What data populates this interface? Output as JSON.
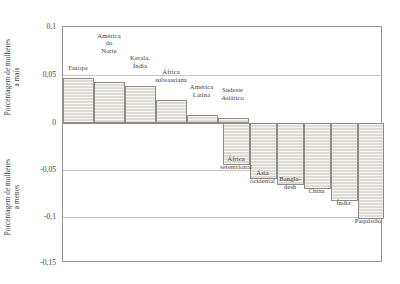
{
  "axis_titles": {
    "top": {
      "line1": "Porcentagem de mulheres",
      "line2": "a mais"
    },
    "bottom": {
      "line1": "Porcentagem de mulheres",
      "line2": "a menos"
    }
  },
  "yticks": [
    "0,1",
    "0,05",
    "0",
    "-0,05",
    "-0,1",
    "-0,15"
  ],
  "chart_data": {
    "type": "bar",
    "title": "",
    "xlabel": "",
    "ylabel": "Porcentagem de mulheres a mais / a menos",
    "ylim": [
      -0.15,
      0.1
    ],
    "yticks": [
      0.1,
      0.05,
      0,
      -0.05,
      -0.1,
      -0.15
    ],
    "ytick_labels": [
      "0,1",
      "0,05",
      "0",
      "-0,05",
      "-0,1",
      "-0,15"
    ],
    "grid": true,
    "legend": "none",
    "orientation": "vertical",
    "categories": [
      "Europa",
      "América do Norte",
      "Kerala, Índia",
      "África subsaariana",
      "América Latina",
      "Sudeste Asiático",
      "África setentrional",
      "Ásia ocidental",
      "Bangladesh",
      "China",
      "Índia",
      "Paquistão"
    ],
    "values": [
      0.048,
      0.043,
      0.039,
      0.024,
      0.008,
      0.005,
      -0.045,
      -0.06,
      -0.066,
      -0.071,
      -0.084,
      -0.103
    ]
  },
  "bars": [
    {
      "name": "Europa",
      "label_lines": [
        "Europa"
      ],
      "value": 0.048,
      "x": 62,
      "w": 31,
      "top": 77,
      "bottom": 122,
      "label_x": 58,
      "label_y": 64,
      "label_w": 40
    },
    {
      "name": "América do Norte",
      "label_lines": [
        "América",
        "do",
        "Norte"
      ],
      "value": 0.043,
      "x": 93,
      "w": 31,
      "top": 81,
      "bottom": 122,
      "label_x": 88,
      "label_y": 47,
      "label_w": 42
    },
    {
      "name": "Kerala, Índia",
      "label_lines": [
        "Kerala,",
        "Índia"
      ],
      "value": 0.039,
      "x": 124,
      "w": 31,
      "top": 85,
      "bottom": 122,
      "label_x": 119,
      "label_y": 62,
      "label_w": 42
    },
    {
      "name": "África subsaariana",
      "label_lines": [
        "África",
        "subsaariana"
      ],
      "value": 0.024,
      "x": 155,
      "w": 31,
      "top": 99,
      "bottom": 122,
      "label_x": 142,
      "label_y": 76,
      "label_w": 58
    },
    {
      "name": "América Latina",
      "label_lines": [
        "América",
        "Latina"
      ],
      "value": 0.008,
      "x": 186,
      "w": 31,
      "top": 114,
      "bottom": 122,
      "label_x": 176,
      "label_y": 91,
      "label_w": 51
    },
    {
      "name": "Sudeste Asiático",
      "label_lines": [
        "Sudeste",
        "Asiático"
      ],
      "value": 0.005,
      "x": 217,
      "w": 31,
      "top": 117,
      "bottom": 122,
      "label_x": 207,
      "label_y": 94,
      "label_w": 51
    },
    {
      "name": "África setentrional",
      "label_lines": [
        "África",
        "setentrional"
      ],
      "value": -0.045,
      "x": 222,
      "w": 27,
      "top": 122,
      "bottom": 164,
      "label_x": 208,
      "label_y": 163,
      "label_w": 56
    },
    {
      "name": "Ásia ocidental",
      "label_lines": [
        "Ásia",
        "ocidental"
      ],
      "value": -0.06,
      "x": 249,
      "w": 27,
      "top": 122,
      "bottom": 178,
      "label_x": 238,
      "label_y": 177,
      "label_w": 49
    },
    {
      "name": "Bangladesh",
      "label_lines": [
        "Bangla-",
        "desh"
      ],
      "value": -0.066,
      "x": 276,
      "w": 27,
      "top": 122,
      "bottom": 184,
      "label_x": 268,
      "label_y": 183,
      "label_w": 44
    },
    {
      "name": "China",
      "label_lines": [
        "China"
      ],
      "value": -0.071,
      "x": 303,
      "w": 27,
      "top": 122,
      "bottom": 188,
      "label_x": 296,
      "label_y": 187,
      "label_w": 41
    },
    {
      "name": "Índia",
      "label_lines": [
        "Índia"
      ],
      "value": -0.084,
      "x": 330,
      "w": 27,
      "top": 122,
      "bottom": 200,
      "label_x": 324,
      "label_y": 199,
      "label_w": 39
    },
    {
      "name": "Paquistão",
      "label_lines": [
        "Paquistão"
      ],
      "value": -0.103,
      "x": 357,
      "w": 26,
      "top": 122,
      "bottom": 218,
      "label_x": 342,
      "label_y": 217,
      "label_w": 52
    }
  ],
  "geometry": {
    "plot_left": 62,
    "plot_top": 26,
    "plot_width": 320,
    "plot_height": 236,
    "y_pixels": {
      "0.1": 26,
      "0.05": 74,
      "0": 122,
      "-0.05": 169,
      "-0.1": 216,
      "-0.15": 262
    }
  },
  "colors": {
    "bar_fill": "#dedad4",
    "bar_stroke": "#8f8c88",
    "gridline": "#c9c6c1",
    "frame": "#999691",
    "text": "#3d3d3c",
    "background": "#ffffff"
  }
}
